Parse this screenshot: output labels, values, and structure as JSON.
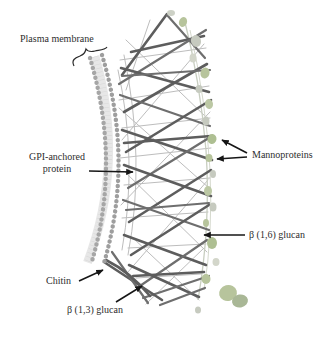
{
  "figure": {
    "labels": {
      "plasma_membrane": "Plasma membrane",
      "gpi_line1": "GPI-anchored",
      "gpi_line2": "protein",
      "mannoproteins": "Mannoproteins",
      "beta_1_6_glucan": "β (1,6) glucan",
      "chitin": "Chitin",
      "beta_1_3_glucan": "β (1,3) glucan"
    },
    "colors": {
      "background": "#ffffff",
      "label_text": "#2e2e2e",
      "arrow": "#161616",
      "glucan_fiber_dark": "#5d5d5d",
      "glucan_fiber_light": "#bdbdbd",
      "membrane_bead": "#9e9e9e",
      "membrane_core": "#e7e7e7",
      "mannoprotein_green": "#b7c49c",
      "mannoprotein_green_dark": "#aebf92",
      "mannoprotein_gray": "#c6cabf",
      "mannoprotein_pale": "#d3d6ca"
    }
  }
}
